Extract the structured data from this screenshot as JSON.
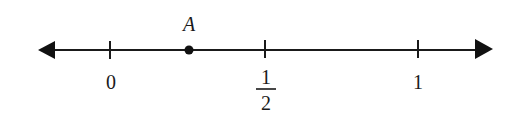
{
  "number_line": {
    "description": "Number line from 0 to 1 with point A between 0 and 1/2",
    "ticks": [
      {
        "label": "0",
        "value": 0,
        "x": 110
      },
      {
        "label_numerator": "1",
        "label_denominator": "2",
        "value": 0.5,
        "x": 265
      },
      {
        "label": "1",
        "value": 1,
        "x": 418
      }
    ],
    "point": {
      "label": "A",
      "x": 189,
      "approx_value": 0.25
    },
    "arrows": {
      "left": true,
      "right": true
    },
    "color": "#1a1a1a"
  }
}
